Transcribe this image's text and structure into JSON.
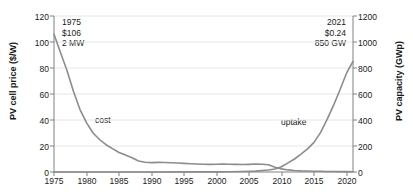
{
  "chart_data": {
    "type": "line",
    "title": "",
    "xlabel": "",
    "ylabel": "PV cell price ($/W)",
    "ylabel_right": "PV capacity (GWp)",
    "xlim": [
      1975,
      2021
    ],
    "ylim": [
      0,
      120
    ],
    "ylim_right": [
      0,
      1200
    ],
    "grid": true,
    "legend_position": "inline-annotations",
    "xticks": [
      "1975",
      "1980",
      "1985",
      "1990",
      "1995",
      "2000",
      "2005",
      "2010",
      "2015",
      "2020"
    ],
    "yticks_left": [
      "0",
      "20",
      "40",
      "60",
      "80",
      "100",
      "120"
    ],
    "yticks_right": [
      "0",
      "200",
      "400",
      "600",
      "800",
      "1000",
      "1200"
    ],
    "series": [
      {
        "name": "cost",
        "axis": "left",
        "unit": "$/W",
        "color": "#8c8c8c",
        "x": [
          1975,
          1976,
          1977,
          1978,
          1979,
          1980,
          1981,
          1982,
          1983,
          1984,
          1985,
          1986,
          1987,
          1988,
          1989,
          1990,
          1991,
          1992,
          1993,
          1994,
          1995,
          1996,
          1997,
          1998,
          1999,
          2000,
          2001,
          2002,
          2003,
          2004,
          2005,
          2006,
          2007,
          2008,
          2009,
          2010,
          2011,
          2012,
          2013,
          2014,
          2015,
          2016,
          2017,
          2018,
          2019,
          2020,
          2021
        ],
        "values": [
          106,
          92,
          78,
          62,
          48,
          38,
          30,
          25,
          21,
          18,
          15,
          13,
          11,
          8.5,
          7.5,
          7.2,
          7.4,
          7.3,
          7.1,
          6.9,
          6.6,
          6.4,
          6.2,
          6.0,
          5.9,
          6.0,
          6.1,
          6.0,
          5.9,
          5.8,
          5.9,
          6.1,
          6.0,
          5.6,
          3.6,
          2.4,
          1.6,
          1.1,
          0.85,
          0.72,
          0.62,
          0.52,
          0.44,
          0.36,
          0.3,
          0.26,
          0.24
        ]
      },
      {
        "name": "uptake",
        "axis": "right",
        "unit": "GWp",
        "color": "#8c8c8c",
        "x": [
          1975,
          1980,
          1985,
          1990,
          1995,
          2000,
          2002,
          2004,
          2006,
          2008,
          2009,
          2010,
          2011,
          2012,
          2013,
          2014,
          2015,
          2016,
          2017,
          2018,
          2019,
          2020,
          2021
        ],
        "values": [
          0.002,
          0.01,
          0.05,
          0.2,
          0.6,
          1.3,
          2,
          3.7,
          6.6,
          15,
          23,
          40,
          70,
          100,
          138,
          178,
          228,
          303,
          403,
          512,
          633,
          760,
          850
        ]
      }
    ],
    "annotations": [
      {
        "name": "start-point",
        "position": "top-left",
        "lines": [
          "1975",
          "$106",
          "2 MW"
        ]
      },
      {
        "name": "end-point",
        "position": "top-right",
        "lines": [
          "2021",
          "$0.24",
          "850 GW"
        ]
      }
    ],
    "inline_labels": [
      {
        "name": "cost",
        "text": "cost"
      },
      {
        "name": "uptake",
        "text": "uptake"
      }
    ]
  }
}
